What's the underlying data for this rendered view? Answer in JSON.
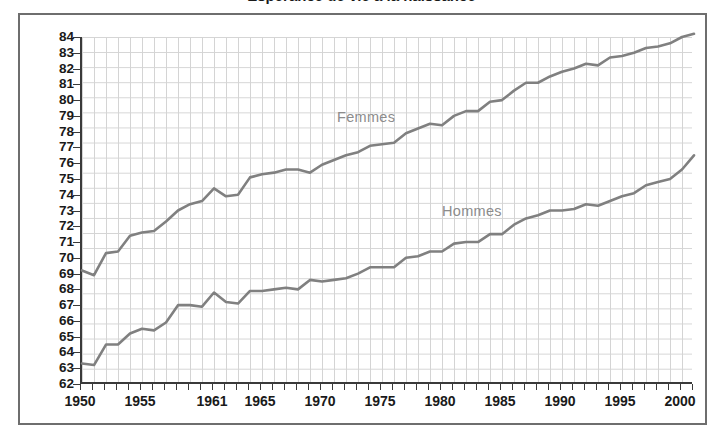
{
  "figure": {
    "title": "Esperance de vie a la naissance",
    "frame_color": "#6e6e6e",
    "axis_color": "#3a3a3a",
    "grid_color": "#d4d4d4",
    "line_color": "#808080",
    "label_color": "#8c8c8c"
  },
  "chart_data": {
    "type": "line",
    "title": "Esperance de vie a la naissance",
    "xlabel": "",
    "ylabel": "",
    "xlim": [
      1950,
      2001
    ],
    "ylim": [
      62,
      84
    ],
    "grid": true,
    "legend": "inline-labels",
    "ytick_labels": [
      "84",
      "83",
      "82",
      "81",
      "80",
      "79",
      "78",
      "77",
      "76",
      "75",
      "74",
      "73",
      "72",
      "71",
      "70",
      "69",
      "68",
      "67",
      "66",
      "65",
      "64",
      "63",
      "62"
    ],
    "xtick_labels": [
      "1950",
      "1955",
      "1961",
      "1965",
      "1970",
      "1975",
      "1980",
      "1985",
      "1990",
      "1995",
      "2000"
    ],
    "xtick_values": [
      1950,
      1955,
      1961,
      1965,
      1970,
      1975,
      1980,
      1985,
      1990,
      1995,
      2000
    ],
    "x": [
      1950,
      1951,
      1952,
      1953,
      1954,
      1955,
      1956,
      1957,
      1958,
      1959,
      1960,
      1961,
      1962,
      1963,
      1964,
      1965,
      1966,
      1967,
      1968,
      1969,
      1970,
      1971,
      1972,
      1973,
      1974,
      1975,
      1976,
      1977,
      1978,
      1979,
      1980,
      1981,
      1982,
      1983,
      1984,
      1985,
      1986,
      1987,
      1988,
      1989,
      1990,
      1991,
      1992,
      1993,
      1994,
      1995,
      1996,
      1997,
      1998,
      1999,
      2000,
      2001
    ],
    "series": [
      {
        "name": "Femmes",
        "label": "Femmes",
        "color": "#808080",
        "values": [
          69.2,
          68.9,
          70.3,
          70.4,
          71.4,
          71.6,
          71.7,
          72.3,
          73.0,
          73.4,
          73.6,
          74.4,
          73.9,
          74.0,
          75.1,
          75.3,
          75.4,
          75.6,
          75.6,
          75.4,
          75.9,
          76.2,
          76.5,
          76.7,
          77.1,
          77.2,
          77.3,
          77.9,
          78.2,
          78.5,
          78.4,
          79.0,
          79.3,
          79.3,
          79.9,
          80.0,
          80.6,
          81.1,
          81.1,
          81.5,
          81.8,
          82.0,
          82.3,
          82.2,
          82.7,
          82.8,
          83.0,
          83.3,
          83.4,
          83.6,
          84.0,
          84.2
        ]
      },
      {
        "name": "Hommes",
        "label": "Hommes",
        "color": "#808080",
        "values": [
          63.3,
          63.2,
          64.5,
          64.5,
          65.2,
          65.5,
          65.4,
          65.9,
          67.0,
          67.0,
          66.9,
          67.8,
          67.2,
          67.1,
          67.9,
          67.9,
          68.0,
          68.1,
          68.0,
          68.6,
          68.5,
          68.6,
          68.7,
          69.0,
          69.4,
          69.4,
          69.4,
          70.0,
          70.1,
          70.4,
          70.4,
          70.9,
          71.0,
          71.0,
          71.5,
          71.5,
          72.1,
          72.5,
          72.7,
          73.0,
          73.0,
          73.1,
          73.4,
          73.3,
          73.6,
          73.9,
          74.1,
          74.6,
          74.8,
          75.0,
          75.6,
          76.5
        ]
      }
    ]
  }
}
